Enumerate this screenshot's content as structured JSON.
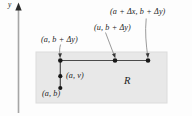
{
  "figure": {
    "type": "math-diagram",
    "axis": {
      "y_label": "y",
      "name": "y-axis"
    },
    "region": {
      "label": "R",
      "fill_color": "#e8e8e8",
      "border_color": "#d0d0d0"
    },
    "labels": {
      "top_right": "(a + Δx, b + Δy)",
      "top_middle": "(u, b + Δy)",
      "top_left": "(a, b + Δy)",
      "mid_left": "(a, v)",
      "bottom_left": "(a, b)"
    },
    "points": [
      {
        "name": "point-a-b-plus-dy",
        "label": "(a, b + Δy)"
      },
      {
        "name": "point-u-b-plus-dy",
        "label": "(u, b + Δy)"
      },
      {
        "name": "point-a-plus-dx-b-plus-dy",
        "label": "(a + Δx, b + Δy)"
      },
      {
        "name": "point-a-v",
        "label": "(a, v)"
      },
      {
        "name": "point-a-b",
        "label": "(a, b)"
      }
    ],
    "colors": {
      "ink": "#1c1c1c",
      "segment": "#4a4a4a",
      "leader": "#8a8a8a",
      "axis": "#9a9a9a"
    }
  }
}
